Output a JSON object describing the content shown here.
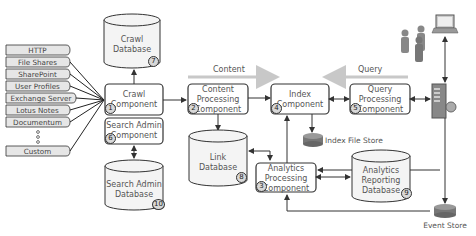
{
  "diagram": {
    "sources": [
      "HTTP",
      "File Shares",
      "SharePoint",
      "User Profiles",
      "Exchange Server",
      "Lotus Notes",
      "Documentum",
      "Custom"
    ],
    "components": {
      "crawl": {
        "label": "Crawl Component",
        "line1": "Crawl",
        "line2": "Component",
        "number": "1"
      },
      "content_processing": {
        "line1": "Content",
        "line2": "Processing",
        "line3": "Component",
        "number": "2"
      },
      "analytics_processing": {
        "line1": "Analytics",
        "line2": "Processing",
        "line3": "Component",
        "number": "3"
      },
      "index": {
        "line1": "Index",
        "line2": "Component",
        "number": "4"
      },
      "query_processing": {
        "line1": "Query",
        "line2": "Processing",
        "line3": "Component",
        "number": "5"
      },
      "search_admin": {
        "line1": "Search Admin",
        "line2": "Component",
        "number": "6"
      }
    },
    "databases": {
      "crawl_db": {
        "line1": "Crawl",
        "line2": "Database",
        "number": "7"
      },
      "link_db": {
        "line1": "Link",
        "line2": "Database",
        "number": "8"
      },
      "analytics_reporting_db": {
        "line1": "Analytics",
        "line2": "Reporting",
        "line3": "Database",
        "number": "9"
      },
      "search_admin_db": {
        "line1": "Search Admin",
        "line2": "Database",
        "number": "10"
      }
    },
    "stores": {
      "index_file_store": "Index File Store",
      "event_store": "Event Store"
    },
    "flows": {
      "content": "Content",
      "query": "Query"
    },
    "colors": {
      "box_border": "#333333",
      "db_fill": "#f4f4f4",
      "source_fill": "#e6e6e6",
      "flow_arrow": "#c8c8c8",
      "line": "#333333"
    }
  }
}
